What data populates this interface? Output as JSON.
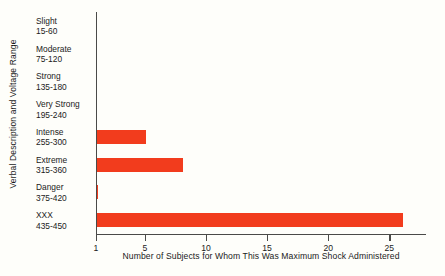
{
  "chart_data": {
    "type": "bar",
    "orientation": "horizontal",
    "title": "",
    "subtitle": "",
    "xlabel": "Number of Subjects for Whom This Was Maximum Shock Administered",
    "ylabel": "Verbal Description and Voltage Range",
    "categories": [
      "Slight",
      "Moderate",
      "Strong",
      "Very Strong",
      "Intense",
      "Extreme",
      "Danger",
      "XXX"
    ],
    "category_ranges": [
      "15-60",
      "75-120",
      "135-180",
      "195-240",
      "255-300",
      "315-360",
      "375-420",
      "435-450"
    ],
    "values": [
      0,
      0,
      0,
      0,
      5,
      8,
      1,
      26
    ],
    "xlim": [
      1,
      28
    ],
    "xticks": [
      1,
      5,
      10,
      15,
      20,
      25
    ],
    "xtick_labels": [
      "1",
      "5",
      "10",
      "15",
      "20",
      "25"
    ],
    "grid": false,
    "legend": false,
    "bar_color": "#f23c1d",
    "axis_color": "#4a4a48",
    "background_color": "#fefefa"
  },
  "axes": {
    "x_title": "Number of Subjects for Whom This Was Maximum Shock Administered",
    "y_title": "Verbal Description and Voltage Range"
  }
}
